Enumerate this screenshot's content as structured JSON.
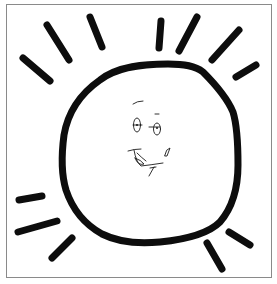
{
  "image": {
    "subject": "hand-drawn sun doodle with smiling face",
    "colors": {
      "background": "#ffffff",
      "stroke": "#0d0d0d",
      "frame_border": "#8a8a8a"
    },
    "elements": {
      "sun_body": "wobbly circle outline",
      "rays_count": 12,
      "face": [
        "eyebrow",
        "left-eye",
        "right-eye",
        "smile",
        "tongue",
        "pencil-mark",
        "chin-mark"
      ]
    }
  }
}
